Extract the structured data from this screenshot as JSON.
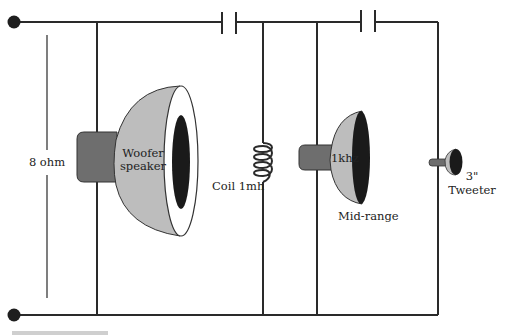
{
  "diagram": {
    "colors": {
      "wire": "#2a2a2a",
      "cone": "#bdbdbd",
      "magnet": "#6e6e6e",
      "rim": "#ffffff",
      "throat": "#1a1a1a"
    },
    "terminals": [
      {
        "id": "top-terminal",
        "x": 14,
        "y": 22
      },
      {
        "id": "bottom-terminal",
        "x": 14,
        "y": 315
      }
    ],
    "impedance": {
      "label": "8 ohm"
    },
    "components": {
      "capacitor_1": {
        "label": ""
      },
      "capacitor_2": {
        "label": ""
      },
      "woofer": {
        "label_line1": "Woofer",
        "label_line2": "speaker"
      },
      "coil": {
        "label": "Coil 1mh"
      },
      "midrange": {
        "label_inside": "1khz",
        "label_below": "Mid-range"
      },
      "tweeter": {
        "label_line1": "3\"",
        "label_line2": "Tweeter"
      }
    }
  }
}
